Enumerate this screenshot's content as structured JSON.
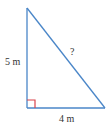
{
  "diagram": {
    "type": "right-triangle",
    "vertices": {
      "top": [
        27,
        8
      ],
      "right_angle": [
        27,
        108
      ],
      "bottom_right": [
        105,
        108
      ]
    },
    "colors": {
      "stroke": "#4a86c8",
      "right_angle_marker": "#d9434b",
      "text": "#333333",
      "background": "#ffffff"
    },
    "labels": {
      "vertical_side": "5 m",
      "horizontal_side": "4 m",
      "hypotenuse": "?"
    }
  }
}
